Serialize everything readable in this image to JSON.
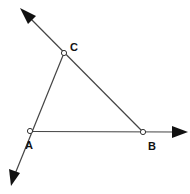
{
  "diagram": {
    "colors": {
      "line": "#444444",
      "arrow": "#111111",
      "point_fill": "#ffffff",
      "point_stroke": "#333333",
      "label": "#111111"
    },
    "points": [
      {
        "id": "A",
        "label": "A",
        "x": 30,
        "y": 131,
        "label_x": 25,
        "label_y": 149
      },
      {
        "id": "B",
        "label": "B",
        "x": 143,
        "y": 132,
        "label_x": 148,
        "label_y": 150
      },
      {
        "id": "C",
        "label": "C",
        "x": 64,
        "y": 53,
        "label_x": 70,
        "label_y": 51
      }
    ],
    "rays": [
      {
        "name": "ray-BC",
        "from": "B",
        "through": "C",
        "arrow_tip": {
          "x": 20,
          "y": 8
        }
      },
      {
        "name": "ray-AB",
        "from": "A",
        "through": "B",
        "arrow_tip": {
          "x": 188,
          "y": 132
        }
      },
      {
        "name": "ray-CA",
        "from": "C",
        "through": "A",
        "arrow_tip": {
          "x": 11,
          "y": 186
        }
      }
    ]
  }
}
